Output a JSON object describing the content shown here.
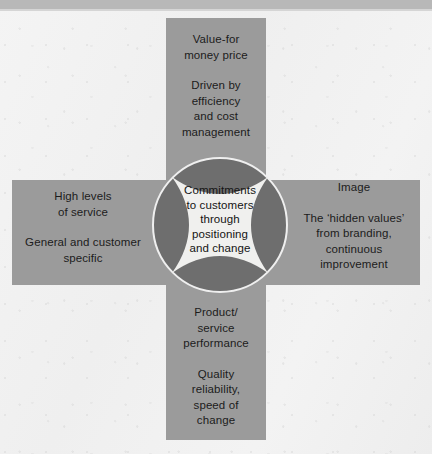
{
  "diagram": {
    "colors": {
      "background": "#f2f2f2",
      "arm_fill": "#9b9b9b",
      "circle_fill": "#6e6e6e",
      "star_fill": "#f0f0ee",
      "ring_stroke": "#efefef",
      "text": "#1a1a1a",
      "page_edge_band": "#b8b8b8"
    },
    "center": {
      "lines": [
        "Commitments",
        "to customers",
        "through",
        "positioning",
        "and change"
      ]
    },
    "arms": {
      "top": {
        "paragraphs": [
          [
            "Value-for",
            "money price"
          ],
          [
            "Driven by",
            "efficiency",
            "and cost",
            "management"
          ]
        ]
      },
      "right": {
        "paragraphs": [
          [
            "Image"
          ],
          [
            "The ‘hidden values’",
            "from branding,",
            "continuous",
            "improvement"
          ]
        ]
      },
      "bottom": {
        "paragraphs": [
          [
            "Product/",
            "service",
            "performance"
          ],
          [
            "Quality",
            "reliability,",
            "speed of",
            "change"
          ]
        ]
      },
      "left": {
        "paragraphs": [
          [
            "High levels",
            "of service"
          ],
          [
            "General and customer",
            "specific"
          ]
        ]
      }
    }
  }
}
